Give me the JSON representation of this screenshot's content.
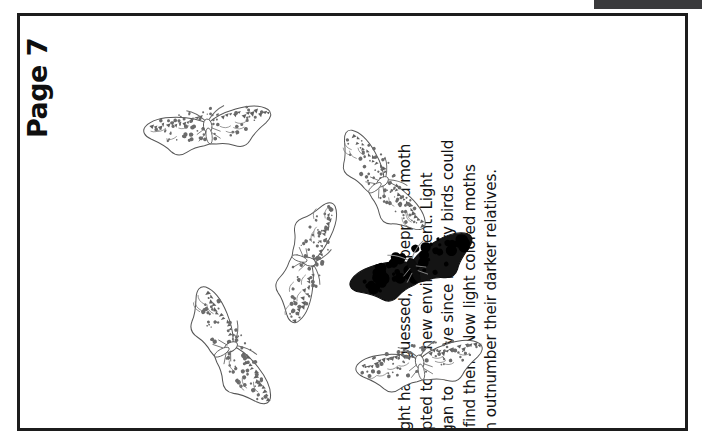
{
  "document": {
    "page_label": "Page 7",
    "scan_artifact": {
      "name": "scan-edge-bar",
      "color": "#3a3a3c"
    },
    "frame_color": "#1c1c1c",
    "background_color": "#ffffff"
  },
  "caption": {
    "lines": [
      "As you might have guessed, the peppered moth",
      "again adapted to its new environment. Light",
      "moths began to survive since hungry birds could",
      "not easily find them. Now light colored moths",
      "once again outnumber their darker relatives."
    ],
    "full_text": "As you might have guessed, the peppered moth again adapted to its new environment. Light moths began to survive since hungry birds could not easily find them. Now light colored moths once again outnumber their darker relatives."
  },
  "illustration": {
    "name": "peppered-moth-population-illustration",
    "light_moth_count": 5,
    "dark_moth_count": 1,
    "light_color": "#ffffff",
    "light_outline_color": "#555555",
    "light_speckle_color": "#6b6b6b",
    "dark_color": "#0d0d0d",
    "moths": [
      {
        "id": "light-moth-1",
        "form": "light",
        "label": "Light peppered moth",
        "x": 113,
        "y": 57,
        "rotation": -8,
        "scale": 1.0
      },
      {
        "id": "light-moth-2",
        "form": "light",
        "label": "Light peppered moth",
        "x": 286,
        "y": 112,
        "rotation": 52,
        "scale": 0.96
      },
      {
        "id": "light-moth-3",
        "form": "light",
        "label": "Light peppered moth",
        "x": 212,
        "y": 190,
        "rotation": 108,
        "scale": 0.98
      },
      {
        "id": "dark-moth-1",
        "form": "dark",
        "label": "Dark (melanic) peppered moth",
        "x": 318,
        "y": 196,
        "rotation": -22,
        "scale": 1.02
      },
      {
        "id": "light-moth-4",
        "form": "light",
        "label": "Light peppered moth",
        "x": 134,
        "y": 277,
        "rotation": 60,
        "scale": 1.04
      },
      {
        "id": "light-moth-5",
        "form": "light",
        "label": "Light peppered moth",
        "x": 325,
        "y": 293,
        "rotation": -10,
        "scale": 1.0
      }
    ]
  }
}
